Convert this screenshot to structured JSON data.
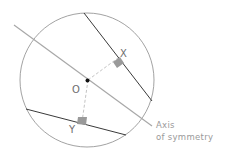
{
  "diagram": {
    "type": "geometry",
    "labels": {
      "center": "O",
      "chord_x": "X",
      "chord_y": "Y",
      "axis_line1": "Axis",
      "axis_line2": "of symmetry"
    },
    "colors": {
      "circle": "#8a8a8a",
      "chord": "#3a3a3a",
      "axis": "#a8a8a8",
      "perpendicular": "#c4c4c4",
      "right_angle_marker": "#9a9a9a",
      "center_point": "#111111",
      "text": "#6e6e6e"
    }
  }
}
